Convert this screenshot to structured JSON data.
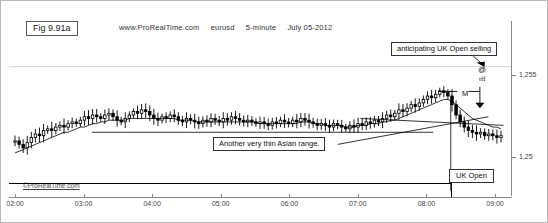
{
  "figure": {
    "tag": "Fig 9.91a",
    "source": "www.ProRealTime.com",
    "instrument": "eurusd",
    "timeframe": "5-minute",
    "date": "July 05-2012",
    "credit": "©ProRealTime.com"
  },
  "annotations": {
    "top_note": "anticipating UK Open selling",
    "mid_note": "Another very thin Asian range.",
    "uk_open": "UK Open",
    "at_marker": "@",
    "tff_marker": "tff",
    "m_label": "M"
  },
  "chart_data": {
    "type": "line",
    "title": "eurusd 5-minute July 05-2012",
    "xlabel": "",
    "ylabel": "",
    "grid": true,
    "legend_position": "none",
    "x_ticks": [
      "02:00",
      "03:00",
      "04:00",
      "05:00",
      "06:00",
      "07:00",
      "08:00",
      "09:00"
    ],
    "y_ticks": [
      "1,25",
      "1,255"
    ],
    "ylim": [
      1.2478,
      1.2566
    ],
    "price_labels": [
      "1,255",
      "1,25"
    ],
    "gridlines": [
      1.255
    ],
    "series": [
      {
        "name": "close",
        "values": [
          1.2507,
          1.2505,
          1.2503,
          1.2506,
          1.2509,
          1.2511,
          1.251,
          1.2513,
          1.2514,
          1.2513,
          1.2515,
          1.2516,
          1.2515,
          1.2517,
          1.2518,
          1.2517,
          1.2519,
          1.2521,
          1.252,
          1.2522,
          1.2521,
          1.252,
          1.2522,
          1.2523,
          1.2521,
          1.2519,
          1.2518,
          1.252,
          1.2522,
          1.2524,
          1.2523,
          1.2525,
          1.2524,
          1.2522,
          1.252,
          1.2519,
          1.2521,
          1.252,
          1.2522,
          1.2521,
          1.2519,
          1.2518,
          1.252,
          1.2519,
          1.2518,
          1.2517,
          1.2519,
          1.2518,
          1.252,
          1.2519,
          1.2518,
          1.252,
          1.2519,
          1.2521,
          1.252,
          1.2519,
          1.2518,
          1.2519,
          1.2518,
          1.2517,
          1.2518,
          1.2517,
          1.2516,
          1.2518,
          1.2517,
          1.2519,
          1.2518,
          1.2517,
          1.2519,
          1.2518,
          1.252,
          1.2519,
          1.2518,
          1.2517,
          1.2516,
          1.2517,
          1.2516,
          1.2515,
          1.2517,
          1.2516,
          1.2515,
          1.2514,
          1.2516,
          1.2515,
          1.2517,
          1.2516,
          1.2518,
          1.2517,
          1.2519,
          1.2518,
          1.252,
          1.2522,
          1.2521,
          1.2523,
          1.2525,
          1.2524,
          1.2526,
          1.2528,
          1.2527,
          1.2529,
          1.2531,
          1.2533,
          1.2532,
          1.2534,
          1.2536,
          1.2535,
          1.2533,
          1.2528,
          1.2522,
          1.2518,
          1.2515,
          1.2513,
          1.2512,
          1.2511,
          1.2512,
          1.251,
          1.2511,
          1.251,
          1.2509,
          1.251
        ]
      },
      {
        "name": "moving-average",
        "values": [
          1.25,
          1.2501,
          1.2502,
          1.2503,
          1.2504,
          1.2505,
          1.2506,
          1.2507,
          1.2508,
          1.2509,
          1.251,
          1.2511,
          1.2512,
          1.2512,
          1.2513,
          1.2514,
          1.2515,
          1.2515,
          1.2516,
          1.2517,
          1.2517,
          1.2518,
          1.2518,
          1.2519,
          1.2519,
          1.2519,
          1.2519,
          1.2519,
          1.252,
          1.252,
          1.252,
          1.252,
          1.252,
          1.252,
          1.252,
          1.252,
          1.252,
          1.252,
          1.252,
          1.252,
          1.2519,
          1.2519,
          1.2519,
          1.2519,
          1.2518,
          1.2518,
          1.2518,
          1.2518,
          1.2518,
          1.2518,
          1.2518,
          1.2518,
          1.2518,
          1.2518,
          1.2518,
          1.2518,
          1.2518,
          1.2518,
          1.2518,
          1.2518,
          1.2517,
          1.2517,
          1.2517,
          1.2517,
          1.2517,
          1.2517,
          1.2517,
          1.2517,
          1.2517,
          1.2517,
          1.2518,
          1.2518,
          1.2518,
          1.2517,
          1.2517,
          1.2517,
          1.2516,
          1.2516,
          1.2516,
          1.2516,
          1.2516,
          1.2515,
          1.2515,
          1.2515,
          1.2516,
          1.2516,
          1.2516,
          1.2517,
          1.2517,
          1.2517,
          1.2518,
          1.2518,
          1.2519,
          1.2519,
          1.252,
          1.2521,
          1.2522,
          1.2523,
          1.2524,
          1.2525,
          1.2526,
          1.2527,
          1.2528,
          1.2529,
          1.253,
          1.2531,
          1.2531,
          1.253,
          1.2528,
          1.2526,
          1.2524,
          1.2522,
          1.252,
          1.2519,
          1.2518,
          1.2517,
          1.2516,
          1.2515,
          1.2515,
          1.2514
        ]
      }
    ],
    "trendlines": [
      {
        "name": "asian-range-support",
        "x1": 0.165,
        "y1": 1.2512,
        "x2": 0.845,
        "y2": 1.2512
      },
      {
        "name": "rising-support",
        "x1": 0.655,
        "y1": 1.2505,
        "x2": 0.955,
        "y2": 1.2521
      },
      {
        "name": "upper-boundary",
        "x1": 0.7,
        "y1": 1.252,
        "x2": 0.985,
        "y2": 1.2516
      }
    ],
    "markers": [
      {
        "name": "entry-at",
        "label": "@",
        "x": 0.945,
        "y": 1.2552
      },
      {
        "name": "measure-M",
        "label": "M",
        "x": 0.905,
        "y": 1.2539
      },
      {
        "name": "down-arrow",
        "x": 0.935,
        "y": 1.2536
      },
      {
        "name": "uk-open-line",
        "x": 0.88
      }
    ]
  }
}
